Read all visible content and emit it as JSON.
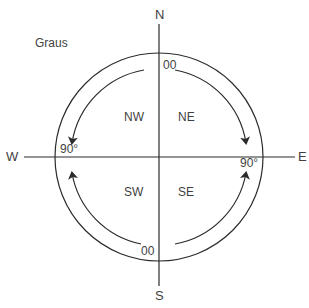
{
  "title": "Graus",
  "cardinals": {
    "north": "N",
    "south": "S",
    "east": "E",
    "west": "W"
  },
  "quadrants": {
    "nw": "NW",
    "ne": "NE",
    "sw": "SW",
    "se": "SE"
  },
  "degree_labels": {
    "top": "00",
    "bottom": "00",
    "left": "90°",
    "right": "90°"
  },
  "colors": {
    "line": "#2b2b2b",
    "text": "#3f3f3f",
    "background": "#ffffff"
  }
}
